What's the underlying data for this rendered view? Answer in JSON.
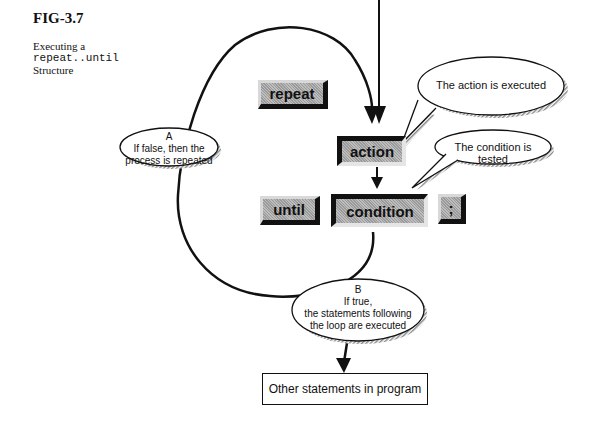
{
  "figure": {
    "label": "FIG-3.7",
    "caption_line1": "Executing a",
    "caption_code": "repeat..until",
    "caption_line3": "Structure"
  },
  "keywords": {
    "repeat": "repeat",
    "action": "action",
    "until": "until",
    "condition": "condition",
    "semicolon": ";"
  },
  "callouts": {
    "action_executed": "The action is executed",
    "condition_tested": "The condition is tested",
    "a_label": "A",
    "a_line1": "If false, then the",
    "a_line2": "process is repeated",
    "b_label": "B",
    "b_line1": "If true,",
    "b_line2": "the statements following",
    "b_line3": "the loop are executed"
  },
  "output_box": {
    "label": "Other statements in program"
  }
}
